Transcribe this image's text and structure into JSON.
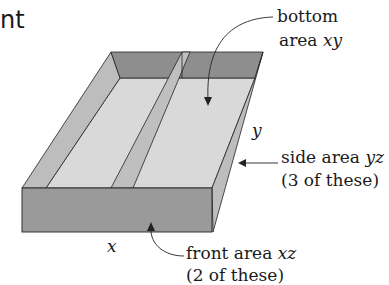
{
  "title_fragment": "nt",
  "colors": {
    "front_face": "#9a9a9a",
    "back_wall": "#8e8e8e",
    "side_wall": "#bdbdbd",
    "floor": "#d9d9d9",
    "divider_top": "#bfbfbf",
    "outline": "#222222"
  },
  "labels": {
    "bottom": {
      "line1": "bottom",
      "line2_text": "area ",
      "line2_var": "xy"
    },
    "side": {
      "line1_text": "side area ",
      "line1_var": "yz",
      "line2": "(3 of these)"
    },
    "front": {
      "line1_text": "front area ",
      "line1_var": "xz",
      "line2": "(2 of these)"
    },
    "dim_x": "x",
    "dim_y": "y"
  }
}
